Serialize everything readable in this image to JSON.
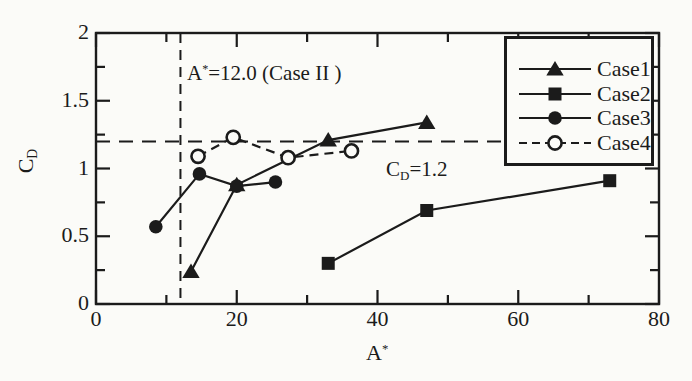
{
  "figure": {
    "background_color": "#fbfbf8",
    "ink_color": "#1b1b1b"
  },
  "chart_data": {
    "type": "line",
    "title": "",
    "xlabel": {
      "main": "A",
      "sup": "*"
    },
    "ylabel": {
      "main": "C",
      "sub": "D"
    },
    "xlim": [
      0,
      80
    ],
    "ylim": [
      0,
      2
    ],
    "x_major_ticks": [
      0,
      20,
      40,
      60,
      80
    ],
    "x_tick_labels": [
      "0",
      "20",
      "40",
      "60",
      "80"
    ],
    "x_minor_ticks": [
      10,
      30,
      50,
      70
    ],
    "y_major_ticks": [
      0,
      0.5,
      1,
      1.5,
      2
    ],
    "y_tick_labels": [
      "0",
      "0.5",
      "1",
      "1.5",
      "2"
    ],
    "y_minor_ticks": [
      0.25,
      0.75,
      1.25,
      1.75
    ],
    "grid": false,
    "legend_position": "top-right",
    "series": [
      {
        "name": "Case1",
        "marker": "triangle-filled",
        "line": "solid",
        "points": [
          [
            13.5,
            0.24
          ],
          [
            20,
            0.88
          ],
          [
            33,
            1.21
          ],
          [
            47,
            1.34
          ]
        ]
      },
      {
        "name": "Case2",
        "marker": "square-filled",
        "line": "solid",
        "points": [
          [
            33,
            0.3
          ],
          [
            47,
            0.69
          ],
          [
            73,
            0.91
          ]
        ]
      },
      {
        "name": "Case3",
        "marker": "circle-filled",
        "line": "solid",
        "points": [
          [
            8.5,
            0.57
          ],
          [
            14.7,
            0.96
          ],
          [
            20,
            0.87
          ],
          [
            25.5,
            0.9
          ]
        ]
      },
      {
        "name": "Case4",
        "marker": "circle-open",
        "line": "dashed",
        "points": [
          [
            14.5,
            1.09
          ],
          [
            19.5,
            1.23
          ],
          [
            27.3,
            1.08
          ],
          [
            36.3,
            1.13
          ]
        ]
      }
    ],
    "annotations": {
      "vline": {
        "value": 12.0,
        "label_main": "A",
        "label_sup": "*",
        "label_rest": "=12.0 (Case II )"
      },
      "hline": {
        "value": 1.2,
        "label_main": "C",
        "label_sub": "D",
        "label_rest": "=1.2"
      }
    }
  }
}
